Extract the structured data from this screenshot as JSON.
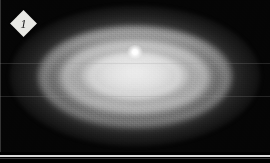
{
  "figure": {
    "type": "astronomical-grayscale-image",
    "colorscale": "grayscale",
    "background_color": "#000000",
    "panel_label": "1",
    "panel_label_shape": "diamond",
    "panel_label_color": "#e8e8e4",
    "panel_label_text_color": "#141414",
    "nucleus_color": "#ffffff",
    "separator_color": "#d9d9d9",
    "scan_artifact_color": "#969696"
  },
  "chart_data": {
    "type": "heatmap",
    "title": "",
    "xlabel": "",
    "ylabel": "",
    "colorbar_label": "",
    "grid": false,
    "legend": "none",
    "annotations": [
      {
        "name": "panel-number",
        "text": "1",
        "x": 23,
        "y": 23,
        "shape": "diamond"
      }
    ],
    "features": [
      {
        "name": "nucleus",
        "center_x": 135,
        "center_y": 52,
        "radius_x": 6,
        "radius_y": 5,
        "brightness": 1.0
      },
      {
        "name": "inner-ring",
        "center_x": 135,
        "center_y": 76,
        "radius_x": 42,
        "radius_y": 19,
        "brightness": 0.82
      },
      {
        "name": "mid-ring",
        "center_x": 135,
        "center_y": 77,
        "radius_x": 68,
        "radius_y": 31,
        "brightness": 0.72
      },
      {
        "name": "outer-ring",
        "center_x": 135,
        "center_y": 78,
        "radius_x": 89,
        "radius_y": 44,
        "brightness": 0.58
      },
      {
        "name": "outer-halo",
        "center_x": 135,
        "center_y": 76,
        "radius_x": 125,
        "radius_y": 70,
        "brightness": 0.22
      }
    ],
    "scan_artifacts_y": [
      63,
      96
    ],
    "extent": {
      "x": [
        0,
        270
      ],
      "y": [
        0,
        152
      ]
    }
  }
}
